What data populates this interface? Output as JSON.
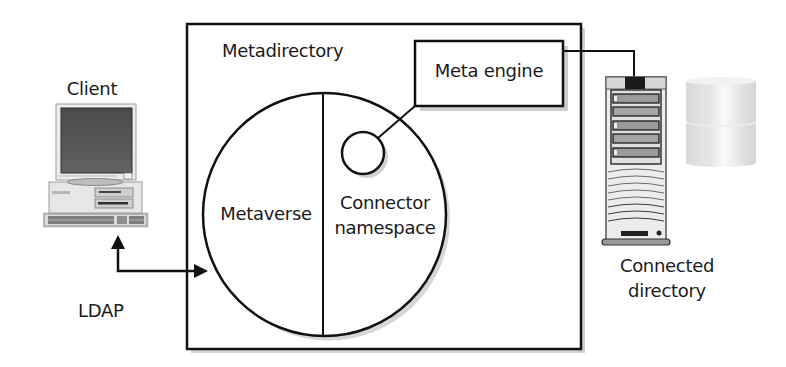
{
  "diagram": {
    "nodes": {
      "client": {
        "label": "Client",
        "icon": "desktop-computer-icon"
      },
      "metadirectory": {
        "label": "Metadirectory"
      },
      "meta_engine": {
        "label": "Meta engine"
      },
      "metaverse": {
        "label": "Metaverse"
      },
      "connector_namespace": {
        "label_line1": "Connector",
        "label_line2": "namespace"
      },
      "connected_directory": {
        "label_line1": "Connected",
        "label_line2": "directory",
        "icons": [
          "server-tower-icon",
          "database-cylinder-icon"
        ]
      }
    },
    "edges": [
      {
        "from": "client",
        "to": "metaverse",
        "label": "LDAP",
        "bidirectional": true
      },
      {
        "from": "connector_namespace",
        "to": "meta_engine",
        "label": ""
      },
      {
        "from": "meta_engine",
        "to": "connected_directory",
        "label": ""
      }
    ],
    "edge_labels": {
      "ldap": "LDAP"
    },
    "colors": {
      "stroke": "#111111",
      "shadow": "#b5b5b5",
      "screen": "#555555",
      "device_body": "#e4e4e4",
      "database": "#e8e8e8"
    }
  }
}
